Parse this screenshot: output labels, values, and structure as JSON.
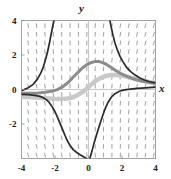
{
  "chart_data": {
    "type": "line",
    "title": "",
    "subtitle": "",
    "xlabel": "x",
    "ylabel": "y",
    "xlim": [
      -4,
      4
    ],
    "ylim": [
      -4,
      4
    ],
    "grid": false,
    "legend_position": "none",
    "xticks": [
      -4,
      -2,
      0,
      2,
      4
    ],
    "xticklabels": [
      "-4",
      "-2",
      "0",
      "2",
      "4"
    ],
    "yticks": [
      4,
      2,
      0,
      -2
    ],
    "yticklabels": [
      "4",
      "2",
      "0",
      "-2"
    ],
    "annotations": [],
    "background_field": {
      "type": "slope-field",
      "description": "grid of short steep tick marks",
      "color": "#555555",
      "x_samples": [
        -3.6,
        -3.1,
        -2.6,
        -2.1,
        -1.6,
        -1.1,
        -0.6,
        -0.1,
        0.4,
        0.9,
        1.4,
        1.9,
        2.4,
        2.9,
        3.4,
        3.9
      ],
      "y_samples": [
        3.7,
        3.2,
        2.7,
        2.2,
        1.7,
        1.2,
        0.7,
        0.2,
        -0.3,
        -0.8,
        -1.3,
        -1.8,
        -2.3,
        -2.8,
        -3.3,
        -3.8
      ]
    },
    "series": [
      {
        "name": "solution-curve-dark-left-branch",
        "color": "#2b2b2b",
        "width": 1.7,
        "points": [
          [
            -4.0,
            -0.28
          ],
          [
            -3.6,
            -0.3
          ],
          [
            -3.2,
            -0.34
          ],
          [
            -2.9,
            -0.4
          ],
          [
            -2.7,
            -0.48
          ],
          [
            -2.5,
            -0.6
          ],
          [
            -2.35,
            -0.75
          ],
          [
            -2.2,
            -0.95
          ],
          [
            -2.05,
            -1.2
          ],
          [
            -1.9,
            -1.5
          ],
          [
            -1.75,
            -1.85
          ],
          [
            -1.6,
            -2.2
          ],
          [
            -1.45,
            -2.55
          ],
          [
            -1.3,
            -2.9
          ],
          [
            -1.1,
            -3.25
          ],
          [
            -0.9,
            -3.5
          ],
          [
            -0.7,
            -3.65
          ],
          [
            -0.5,
            -3.78
          ],
          [
            -0.3,
            -3.9
          ],
          [
            -0.12,
            -4.0
          ]
        ]
      },
      {
        "name": "solution-curve-dark-upper-left",
        "color": "#2b2b2b",
        "width": 1.7,
        "points": [
          [
            -3.95,
            -0.05
          ],
          [
            -3.6,
            0.1
          ],
          [
            -3.3,
            0.3
          ],
          [
            -3.05,
            0.6
          ],
          [
            -2.85,
            0.95
          ],
          [
            -2.7,
            1.3
          ],
          [
            -2.56,
            1.75
          ],
          [
            -2.44,
            2.2
          ],
          [
            -2.34,
            2.65
          ],
          [
            -2.25,
            3.1
          ],
          [
            -2.17,
            3.5
          ],
          [
            -2.11,
            3.8
          ],
          [
            -2.06,
            4.0
          ]
        ]
      },
      {
        "name": "solution-curve-dark-right-descending",
        "color": "#2b2b2b",
        "width": 1.7,
        "points": [
          [
            1.28,
            4.0
          ],
          [
            1.36,
            3.6
          ],
          [
            1.46,
            3.15
          ],
          [
            1.58,
            2.7
          ],
          [
            1.72,
            2.3
          ],
          [
            1.88,
            1.92
          ],
          [
            2.06,
            1.6
          ],
          [
            2.26,
            1.3
          ],
          [
            2.5,
            1.05
          ],
          [
            2.76,
            0.85
          ],
          [
            3.04,
            0.68
          ],
          [
            3.34,
            0.55
          ],
          [
            3.64,
            0.45
          ],
          [
            4.0,
            0.38
          ]
        ]
      },
      {
        "name": "solution-curve-dark-right-ascending",
        "color": "#2b2b2b",
        "width": 1.7,
        "points": [
          [
            0.08,
            -4.0
          ],
          [
            0.2,
            -3.6
          ],
          [
            0.32,
            -3.15
          ],
          [
            0.46,
            -2.7
          ],
          [
            0.6,
            -2.25
          ],
          [
            0.74,
            -1.82
          ],
          [
            0.88,
            -1.42
          ],
          [
            1.02,
            -1.05
          ],
          [
            1.18,
            -0.72
          ],
          [
            1.36,
            -0.45
          ],
          [
            1.58,
            -0.24
          ],
          [
            1.84,
            -0.1
          ],
          [
            2.14,
            -0.02
          ],
          [
            2.5,
            0.02
          ],
          [
            2.9,
            0.06
          ],
          [
            3.4,
            0.1
          ],
          [
            4.0,
            0.14
          ]
        ]
      },
      {
        "name": "solution-curve-medium-gray-hump",
        "color": "#8c8c8c",
        "width": 3.0,
        "points": [
          [
            -4.0,
            -0.22
          ],
          [
            -3.5,
            -0.22
          ],
          [
            -3.0,
            -0.2
          ],
          [
            -2.6,
            -0.16
          ],
          [
            -2.2,
            -0.1
          ],
          [
            -1.9,
            -0.02
          ],
          [
            -1.6,
            0.12
          ],
          [
            -1.35,
            0.3
          ],
          [
            -1.1,
            0.52
          ],
          [
            -0.85,
            0.78
          ],
          [
            -0.6,
            1.02
          ],
          [
            -0.35,
            1.26
          ],
          [
            -0.1,
            1.44
          ],
          [
            0.15,
            1.56
          ],
          [
            0.4,
            1.62
          ],
          [
            0.62,
            1.62
          ],
          [
            0.85,
            1.56
          ],
          [
            1.1,
            1.44
          ],
          [
            1.35,
            1.28
          ],
          [
            1.6,
            1.12
          ],
          [
            1.9,
            0.94
          ],
          [
            2.2,
            0.8
          ],
          [
            2.55,
            0.66
          ],
          [
            2.9,
            0.55
          ],
          [
            3.3,
            0.46
          ],
          [
            3.65,
            0.4
          ],
          [
            4.0,
            0.36
          ]
        ]
      },
      {
        "name": "solution-curve-light-gray-flat",
        "color": "#c9c9c9",
        "width": 4.5,
        "points": [
          [
            -4.0,
            -0.42
          ],
          [
            -3.6,
            -0.44
          ],
          [
            -3.2,
            -0.46
          ],
          [
            -2.9,
            -0.48
          ],
          [
            -2.6,
            -0.5
          ],
          [
            -2.3,
            -0.52
          ],
          [
            -2.0,
            -0.54
          ],
          [
            -1.7,
            -0.55
          ],
          [
            -1.4,
            -0.54
          ],
          [
            -1.1,
            -0.5
          ],
          [
            -0.85,
            -0.42
          ],
          [
            -0.6,
            -0.3
          ],
          [
            -0.35,
            -0.14
          ],
          [
            -0.1,
            0.06
          ],
          [
            0.15,
            0.28
          ],
          [
            0.4,
            0.48
          ],
          [
            0.7,
            0.66
          ],
          [
            1.0,
            0.78
          ],
          [
            1.35,
            0.84
          ],
          [
            1.7,
            0.84
          ],
          [
            2.05,
            0.8
          ],
          [
            2.4,
            0.72
          ],
          [
            2.8,
            0.62
          ],
          [
            3.2,
            0.52
          ],
          [
            3.6,
            0.44
          ],
          [
            4.0,
            0.38
          ]
        ]
      }
    ]
  },
  "axes": {
    "y_axis_label": "y",
    "x_axis_label": "x"
  },
  "colors": {
    "frame": "#999999",
    "axis": "#bbbbbb",
    "field": "#555555",
    "curve_dark": "#2b2b2b",
    "curve_medium": "#8c8c8c",
    "curve_light": "#c9c9c9",
    "background": "#ffffff",
    "text": "#1a1a1a"
  }
}
